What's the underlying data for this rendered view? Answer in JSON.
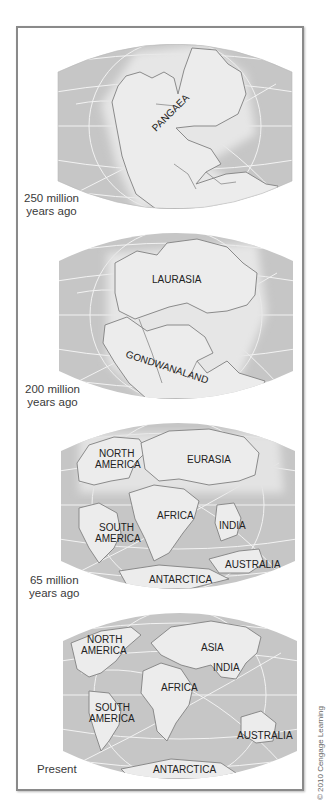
{
  "figure": {
    "colors": {
      "ocean": "#c6c6c6",
      "ocean_glow": "#e4e4e4",
      "land": "#ececec",
      "coastline": "#8a8a8a",
      "gridline": "#f4f4f4",
      "frame": "#8a8a8a"
    },
    "panels": [
      {
        "era_line1": "250 million",
        "era_line2": "years ago",
        "labels": [
          "PANGAEA"
        ]
      },
      {
        "era_line1": "200 million",
        "era_line2": "years ago",
        "labels": [
          "LAURASIA",
          "GONDWANALAND"
        ]
      },
      {
        "era_line1": "65 million",
        "era_line2": "years ago",
        "labels": [
          "NORTH",
          "AMERICA",
          "EURASIA",
          "AFRICA",
          "SOUTH",
          "AMERICA",
          "INDIA",
          "AUSTRALIA",
          "ANTARCTICA"
        ]
      },
      {
        "era_line1": "Present",
        "labels": [
          "NORTH",
          "AMERICA",
          "ASIA",
          "INDIA",
          "AFRICA",
          "SOUTH",
          "AMERICA",
          "AUSTRALIA",
          "ANTARCTICA"
        ]
      }
    ],
    "credit": "© 2010 Cengage Learning"
  }
}
